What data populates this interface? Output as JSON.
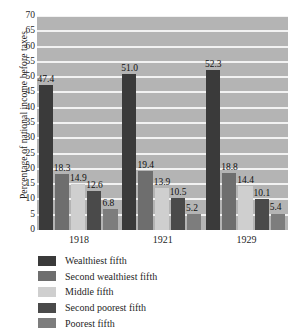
{
  "chart_data": {
    "type": "bar",
    "title": "",
    "subtitle": "",
    "xlabel": "",
    "ylabel": "Percentage of national income before taxes",
    "categories": [
      "1918",
      "1921",
      "1929"
    ],
    "ylim": [
      0,
      70
    ],
    "ytick_step": 5,
    "yticks": [
      "70",
      "65",
      "60",
      "55",
      "50",
      "45",
      "40",
      "35",
      "30",
      "25",
      "20",
      "15",
      "10",
      "5",
      "0"
    ],
    "grid": "horizontal",
    "legend_position": "below",
    "show_data_labels": true,
    "series": [
      {
        "name": "Wealthiest fifth",
        "color": "#3a3a3a",
        "values": [
          47.4,
          51.0,
          52.3
        ],
        "labels": [
          "47.4",
          "51.0",
          "52.3"
        ]
      },
      {
        "name": "Second wealthiest fifth",
        "color": "#6e6e6e",
        "values": [
          18.3,
          19.4,
          18.8
        ],
        "labels": [
          "18.3",
          "19.4",
          "18.8"
        ]
      },
      {
        "name": "Middle fifth",
        "color": "#cfcfcf",
        "values": [
          14.9,
          13.9,
          14.4
        ],
        "labels": [
          "14.9",
          "13.9",
          "14.4"
        ]
      },
      {
        "name": "Second poorest fifth",
        "color": "#4a4a4a",
        "values": [
          12.6,
          10.5,
          10.1
        ],
        "labels": [
          "12.6",
          "10.5",
          "10.1"
        ]
      },
      {
        "name": "Poorest fifth",
        "color": "#7d7d7d",
        "values": [
          6.8,
          5.2,
          5.4
        ],
        "labels": [
          "6.8",
          "5.2",
          "5.4"
        ]
      }
    ],
    "colors": {
      "plot_background": "#b4b4b4",
      "gridline": "#f2f2f2",
      "page_background": "#ffffff",
      "text": "#1f1f1f"
    }
  }
}
